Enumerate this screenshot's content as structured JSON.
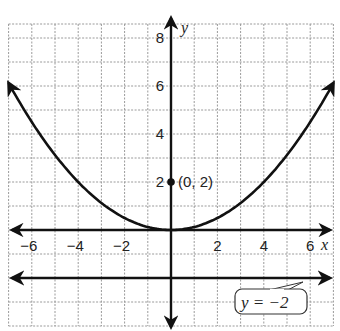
{
  "graph": {
    "x_axis_label": "x",
    "y_axis_label": "y",
    "x_ticks": [
      {
        "value": -6,
        "label": "−6"
      },
      {
        "value": -4,
        "label": "−4"
      },
      {
        "value": -2,
        "label": "−2"
      },
      {
        "value": 2,
        "label": "2"
      },
      {
        "value": 4,
        "label": "4"
      },
      {
        "value": 6,
        "label": "6"
      }
    ],
    "y_ticks": [
      {
        "value": 2,
        "label": "2"
      },
      {
        "value": 4,
        "label": "4"
      },
      {
        "value": 6,
        "label": "6"
      },
      {
        "value": 8,
        "label": "8"
      }
    ],
    "x_range": [
      -7,
      7
    ],
    "y_range": [
      -4,
      9
    ],
    "curve": {
      "type": "parabola",
      "description": "vertex at origin, opens upward"
    },
    "point": {
      "x": 0,
      "y": 2,
      "label": "(0, 2)"
    },
    "directrix": {
      "equation_label": "y = −2",
      "y": -2
    },
    "colors": {
      "line": "#111111",
      "grid": "#9a9a9a"
    }
  }
}
